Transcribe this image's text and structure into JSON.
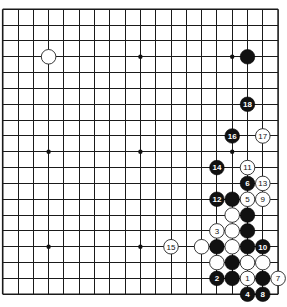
{
  "board": {
    "size": 19,
    "origin_x": 2.7,
    "origin_y": 9.3,
    "spacing_x": 15.3,
    "spacing_y": 15.83,
    "stone_radius": 7.3,
    "colors": {
      "black": "#111111",
      "white": "#ffffff",
      "line": "#1a1a1a",
      "background": "#ffffff"
    }
  },
  "star_points": [
    [
      3,
      3
    ],
    [
      9,
      3
    ],
    [
      15,
      3
    ],
    [
      3,
      9
    ],
    [
      9,
      9
    ],
    [
      15,
      9
    ],
    [
      3,
      15
    ],
    [
      9,
      15
    ],
    [
      15,
      15
    ]
  ],
  "stones": [
    {
      "color": "white",
      "col": 3,
      "row": 3,
      "label": ""
    },
    {
      "color": "black",
      "col": 16,
      "row": 3,
      "label": ""
    },
    {
      "color": "black",
      "col": 16,
      "row": 6,
      "label": "18"
    },
    {
      "color": "black",
      "col": 15,
      "row": 8,
      "label": "16"
    },
    {
      "color": "white",
      "col": 17,
      "row": 8,
      "label": "17"
    },
    {
      "color": "black",
      "col": 14,
      "row": 10,
      "label": "14"
    },
    {
      "color": "white",
      "col": 16,
      "row": 10,
      "label": "11"
    },
    {
      "color": "black",
      "col": 16,
      "row": 11,
      "label": "6"
    },
    {
      "color": "white",
      "col": 17,
      "row": 11,
      "label": "13"
    },
    {
      "color": "black",
      "col": 14,
      "row": 12,
      "label": "12"
    },
    {
      "color": "black",
      "col": 15,
      "row": 12,
      "label": ""
    },
    {
      "color": "white",
      "col": 16,
      "row": 12,
      "label": "5"
    },
    {
      "color": "white",
      "col": 17,
      "row": 12,
      "label": "9"
    },
    {
      "color": "white",
      "col": 15,
      "row": 13,
      "label": ""
    },
    {
      "color": "black",
      "col": 16,
      "row": 13,
      "label": ""
    },
    {
      "color": "white",
      "col": 14,
      "row": 14,
      "label": "3"
    },
    {
      "color": "white",
      "col": 15,
      "row": 14,
      "label": ""
    },
    {
      "color": "black",
      "col": 16,
      "row": 14,
      "label": ""
    },
    {
      "color": "white",
      "col": 11,
      "row": 15,
      "label": "15"
    },
    {
      "color": "white",
      "col": 13,
      "row": 15,
      "label": ""
    },
    {
      "color": "black",
      "col": 14,
      "row": 15,
      "label": ""
    },
    {
      "color": "white",
      "col": 15,
      "row": 15,
      "label": ""
    },
    {
      "color": "black",
      "col": 16,
      "row": 15,
      "label": ""
    },
    {
      "color": "black",
      "col": 17,
      "row": 15,
      "label": "10"
    },
    {
      "color": "white",
      "col": 14,
      "row": 16,
      "label": ""
    },
    {
      "color": "black",
      "col": 15,
      "row": 16,
      "label": ""
    },
    {
      "color": "white",
      "col": 16,
      "row": 16,
      "label": ""
    },
    {
      "color": "white",
      "col": 17,
      "row": 16,
      "label": ""
    },
    {
      "color": "black",
      "col": 14,
      "row": 17,
      "label": "2"
    },
    {
      "color": "black",
      "col": 15,
      "row": 17,
      "label": ""
    },
    {
      "color": "white",
      "col": 16,
      "row": 17,
      "label": "1"
    },
    {
      "color": "black",
      "col": 17,
      "row": 17,
      "label": ""
    },
    {
      "color": "white",
      "col": 18,
      "row": 17,
      "label": "7"
    },
    {
      "color": "black",
      "col": 16,
      "row": 18,
      "label": "4"
    },
    {
      "color": "black",
      "col": 17,
      "row": 18,
      "label": "8"
    }
  ]
}
